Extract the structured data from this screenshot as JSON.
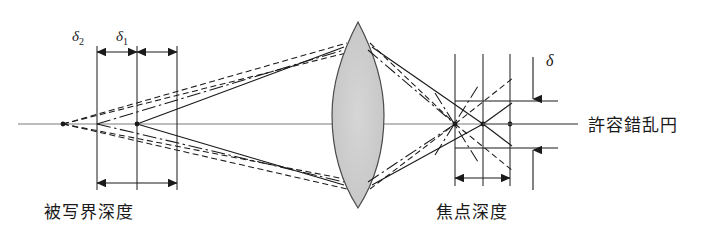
{
  "figure": {
    "type": "optical-ray-diagram",
    "title_visible": false,
    "background": "#ffffff",
    "ink_color": "#1a1a1a",
    "axis_color": "#6b6b6b",
    "lens_fill": "#cccccc",
    "lens_stroke": "#3a3a3a"
  },
  "labels": {
    "delta2": "δ",
    "delta2_sub": "2",
    "delta1": "δ",
    "delta1_sub": "1",
    "delta": "δ",
    "depth_of_field": "被写界深度",
    "depth_of_focus": "焦点深度",
    "circle_of_confusion": "許容錯乱円"
  },
  "geometry": {
    "axis_y": 124,
    "axis_x_start": 18,
    "axis_x_end": 578,
    "object_point_x": 63,
    "near_plane_x": 97,
    "focus_plane_x": 137,
    "far_plane_x": 177,
    "lens_center_x": 358,
    "lens_top_y": 22,
    "lens_bottom_y": 208,
    "lens_half_width": 26,
    "lens_aperture_top_y": 47,
    "lens_aperture_bottom_y": 185,
    "image_near_x": 455,
    "image_focus_x": 483,
    "image_far_x": 510,
    "coc_top_y": 101,
    "coc_bottom_y": 148,
    "coc_tick_x_end": 558,
    "dim_top_y": 52,
    "dim_bottom_left_y": 183,
    "dim_bottom_right_y": 178
  },
  "line_styles": {
    "solid": "in-focus marginal rays",
    "dashed": "far-limit rays",
    "dashdot": "near-limit rays"
  }
}
